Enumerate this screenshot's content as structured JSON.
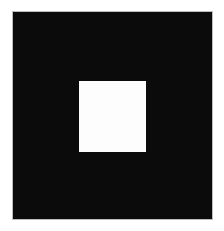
{
  "image": {
    "description": "Black square with a smaller white square centered slightly above middle",
    "background_color": "#ffffff",
    "shapes": [
      {
        "name": "outer-square",
        "color": "#0b0b0b",
        "x": 13,
        "y": 12,
        "width": 199,
        "height": 207
      },
      {
        "name": "inner-square",
        "color": "#fdfdfd",
        "x": 79,
        "y": 81,
        "width": 67,
        "height": 71
      }
    ]
  }
}
